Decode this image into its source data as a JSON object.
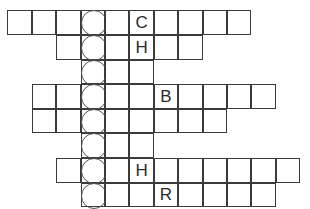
{
  "puzzle": {
    "type": "crossword-acrostic",
    "grid_origin": {
      "x": 8,
      "y": 11
    },
    "cell_size": {
      "w": 24.4,
      "h": 24.6
    },
    "highlight_column": 3,
    "colors": {
      "line": "#3a3a3a",
      "circle": "#555555",
      "letter": "#2b2b2b",
      "background": "#ffffff"
    },
    "rows": [
      {
        "index": 0,
        "start_col": 0,
        "end_col": 9,
        "letters": {
          "5": "C"
        }
      },
      {
        "index": 1,
        "start_col": 2,
        "end_col": 7,
        "letters": {
          "5": "H"
        }
      },
      {
        "index": 2,
        "start_col": 3,
        "end_col": 5,
        "letters": {}
      },
      {
        "index": 3,
        "start_col": 1,
        "end_col": 10,
        "letters": {
          "6": "B"
        }
      },
      {
        "index": 4,
        "start_col": 1,
        "end_col": 8,
        "letters": {}
      },
      {
        "index": 5,
        "start_col": 3,
        "end_col": 5,
        "letters": {}
      },
      {
        "index": 6,
        "start_col": 2,
        "end_col": 11,
        "letters": {
          "5": "H"
        }
      },
      {
        "index": 7,
        "start_col": 3,
        "end_col": 10,
        "letters": {
          "6": "R"
        }
      }
    ]
  }
}
